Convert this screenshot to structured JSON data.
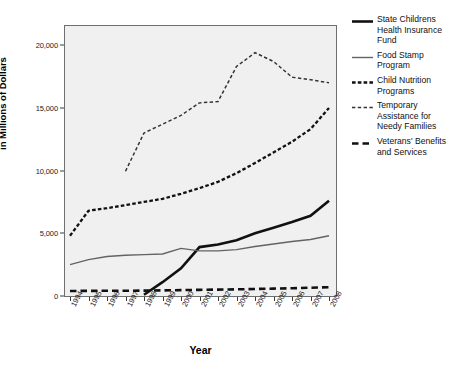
{
  "chart_data": {
    "type": "line",
    "title": "",
    "xlabel": "Year",
    "ylabel": "in Millions of Dollars",
    "grid": false,
    "legend_position": "right",
    "xlim": [
      1994,
      2008
    ],
    "ylim": [
      0,
      21500
    ],
    "yticks": [
      0,
      5000,
      10000,
      15000,
      20000
    ],
    "ytick_labels": [
      "0",
      "5,000",
      "10,000",
      "15,000",
      "20,000"
    ],
    "categories": [
      "1994",
      "1995",
      "1996",
      "1997",
      "1998",
      "1999",
      "2000",
      "2001",
      "2002",
      "2003",
      "2004",
      "2005",
      "2006",
      "2007",
      "2008"
    ],
    "series": [
      {
        "name": "State Childrens Health Insurance Fund",
        "style": "solid-thick-black",
        "color": "#111111",
        "values": [
          null,
          null,
          null,
          null,
          100,
          1100,
          2200,
          3900,
          4100,
          4450,
          5000,
          5450,
          5900,
          6400,
          7600
        ]
      },
      {
        "name": "Food Stamp Program",
        "style": "solid-thin-gray",
        "color": "#636363",
        "values": [
          2500,
          2900,
          3150,
          3250,
          3300,
          3350,
          3800,
          3600,
          3600,
          3700,
          3950,
          4150,
          4350,
          4500,
          4800
        ]
      },
      {
        "name": "Child Nutrition Programs",
        "style": "dashed-medium",
        "color": "#111111",
        "values": [
          4800,
          6800,
          7000,
          7250,
          7500,
          7750,
          8150,
          8600,
          9100,
          9800,
          10600,
          11450,
          12300,
          13300,
          15000
        ]
      },
      {
        "name": "Temporary Assistance for Needy Families",
        "style": "dashed-fine",
        "color": "#333333",
        "values": [
          null,
          null,
          null,
          9950,
          13000,
          13700,
          14400,
          15400,
          15500,
          18300,
          19400,
          18700,
          17450,
          17250,
          17000
        ]
      },
      {
        "name": "Veterans' Benefits and Services",
        "style": "dashed-bold",
        "color": "#111111",
        "values": [
          400,
          410,
          415,
          420,
          430,
          450,
          470,
          490,
          510,
          530,
          560,
          590,
          620,
          660,
          700
        ]
      }
    ]
  },
  "axes": {
    "y_title": "in Millions of Dollars",
    "x_title": "Year",
    "y_labels": [
      "20,000",
      "15,000",
      "10,000",
      "5,000",
      "0"
    ],
    "x_labels": [
      "1994",
      "1995",
      "1996",
      "1997",
      "1998",
      "1999",
      "2000",
      "2001",
      "2002",
      "2003",
      "2004",
      "2005",
      "2006",
      "2007",
      "2008"
    ]
  },
  "legend": {
    "items": [
      {
        "label": "State Childrens Health Insurance Fund",
        "swatch": "solid-thick-line-icon"
      },
      {
        "label": "Food Stamp Program",
        "swatch": "solid-thin-line-icon"
      },
      {
        "label": "Child Nutrition Programs",
        "swatch": "dashed-medium-line-icon"
      },
      {
        "label": "Temporary Assistance for Needy Families",
        "swatch": "dashed-fine-line-icon"
      },
      {
        "label": "Veterans' Benefits and Services",
        "swatch": "dashed-bold-line-icon"
      }
    ]
  }
}
